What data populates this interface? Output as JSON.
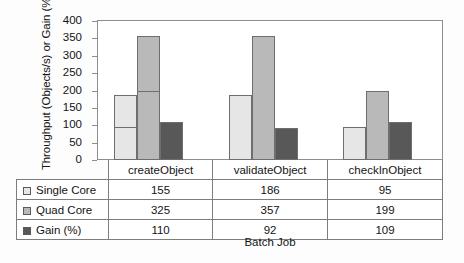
{
  "chart_data": {
    "type": "bar",
    "title": "",
    "xlabel": "Batch Job",
    "ylabel": "Throughput (Objects/s) or Gain (%)",
    "categories": [
      "createObject",
      "validateObject",
      "checkInObject"
    ],
    "series": [
      {
        "name": "Single Core",
        "values": [
          155,
          186,
          95
        ],
        "color": "#e6e6e6"
      },
      {
        "name": "Quad Core",
        "values": [
          325,
          357,
          199
        ],
        "color": "#b9b9b9"
      },
      {
        "name": "Gain (%)",
        "values": [
          110,
          92,
          109
        ],
        "color": "#585858"
      }
    ],
    "ylim": [
      0,
      400
    ],
    "yticks": [
      0,
      50,
      100,
      150,
      200,
      250,
      300,
      350,
      400
    ],
    "ytick_labels": [
      "0",
      "50",
      "100",
      "150",
      "200",
      "250",
      "300",
      "350",
      "400"
    ],
    "grid": false,
    "legend_position": "table-left-column"
  },
  "table": {
    "header_row": [
      "",
      "createObject",
      "validateObject",
      "checkInObject"
    ],
    "rows": [
      {
        "label": "Single Core",
        "swatch": "#e6e6e6",
        "values": [
          "155",
          "186",
          "95"
        ]
      },
      {
        "label": "Quad Core",
        "swatch": "#b9b9b9",
        "values": [
          "325",
          "357",
          "199"
        ]
      },
      {
        "label": "Gain (%)",
        "swatch": "#585858",
        "values": [
          "110",
          "92",
          "109"
        ]
      }
    ]
  }
}
